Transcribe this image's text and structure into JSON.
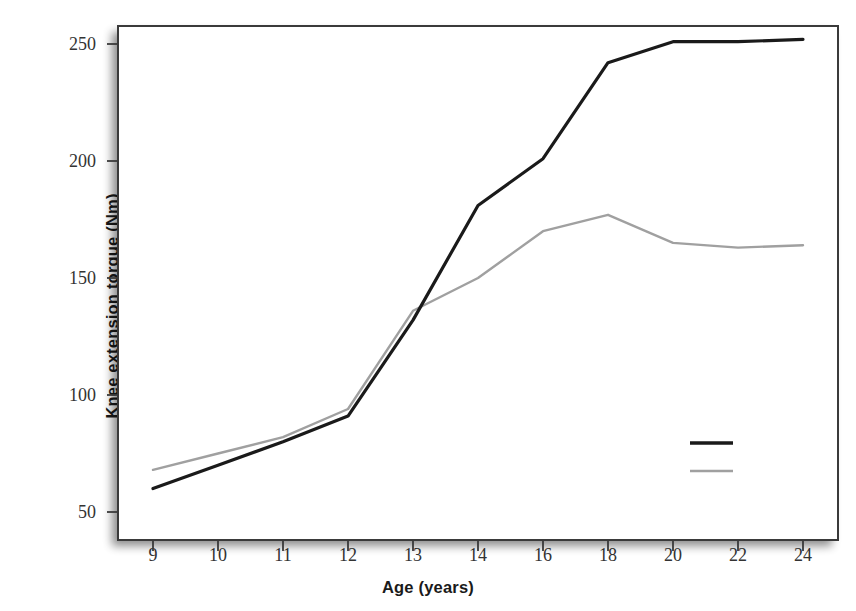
{
  "chart_data": {
    "type": "line",
    "title": "",
    "xlabel": "Age (years)",
    "ylabel": "Knee extension torque (Nm)",
    "categories": [
      "9",
      "10",
      "11",
      "12",
      "13",
      "14",
      "16",
      "18",
      "20",
      "22",
      "24"
    ],
    "xticklabels": [
      "9",
      "10",
      "11",
      "12",
      "13",
      "14",
      "16",
      "18",
      "20",
      "22",
      "24"
    ],
    "yticks": [
      50,
      100,
      150,
      200,
      250
    ],
    "yticklabels": [
      "50",
      "100",
      "150",
      "200",
      "250"
    ],
    "ylim": [
      38,
      262
    ],
    "grid": false,
    "legend_position": "lower-right-inside",
    "series": [
      {
        "name": "Males",
        "color": "#1a1a1a",
        "linewidth": 3.2,
        "values": [
          60,
          70,
          80,
          91,
          132,
          181,
          201,
          242,
          251,
          251,
          252
        ]
      },
      {
        "name": "Females",
        "color": "#a0a0a0",
        "linewidth": 2.4,
        "values": [
          68,
          75,
          82,
          94,
          136,
          150,
          170,
          177,
          165,
          163,
          164
        ]
      }
    ]
  },
  "legend": {
    "items": [
      {
        "label": "Males"
      },
      {
        "label": "Females"
      }
    ]
  },
  "axes": {
    "x_title": "Age (years)",
    "y_title": "Knee extension torque (Nm)"
  }
}
